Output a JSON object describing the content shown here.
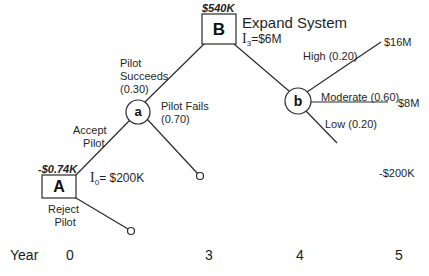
{
  "diagram": {
    "type": "decision-tree",
    "nodes": {
      "A": {
        "label": "A",
        "kind": "decision",
        "value": "-$0.74K",
        "investment_symbol": "I",
        "investment_subscript": "0",
        "investment_text": "= $200K"
      },
      "a": {
        "label": "a",
        "kind": "chance"
      },
      "B": {
        "label": "B",
        "kind": "decision",
        "value": "$540K",
        "title": "Expand System",
        "investment_symbol": "I",
        "investment_subscript": "3",
        "investment_text": "=$6M"
      },
      "b": {
        "label": "b",
        "kind": "chance"
      }
    },
    "branches": {
      "accept_pilot": {
        "line1": "Accept",
        "line2": "Pilot"
      },
      "reject_pilot": {
        "line1": "Reject",
        "line2": "Pilot"
      },
      "pilot_succeeds": {
        "line1": "Pilot",
        "line2": "Succeeds",
        "line3": "(0.30)"
      },
      "pilot_fails": {
        "line1": "Pilot Fails",
        "line2": "(0.70)"
      },
      "high": {
        "label": "High (0.20)",
        "payoff": "$16M"
      },
      "moderate": {
        "label": "Moderate (0.60)",
        "payoff": "$8M"
      },
      "low": {
        "label": "Low (0.20)",
        "payoff": "-$200K"
      }
    },
    "timeline": {
      "label": "Year",
      "ticks": [
        "0",
        "3",
        "4",
        "5"
      ]
    },
    "colors": {
      "line": "#2a2a2a",
      "text": "#1f1f1f",
      "background": "#ffffff"
    }
  }
}
